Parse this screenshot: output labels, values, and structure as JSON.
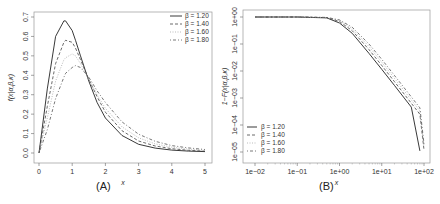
{
  "chart_data": [
    {
      "panel": "A",
      "type": "line",
      "caption": "(A)",
      "title": "",
      "xlabel": "x",
      "ylabel": "f(x|α,β,κ)",
      "xlim": [
        0,
        5
      ],
      "ylim": [
        0,
        0.7
      ],
      "xticks": [
        "0",
        "1",
        "2",
        "3",
        "4",
        "5"
      ],
      "yticks": [
        "0.0",
        "0.1",
        "0.2",
        "0.3",
        "0.4",
        "0.5",
        "0.6",
        "0.7"
      ],
      "grid": false,
      "legend_position": "top-right",
      "x": [
        0,
        0.25,
        0.5,
        0.75,
        0.8,
        1.0,
        1.1,
        1.25,
        1.5,
        1.75,
        2.0,
        2.5,
        3.0,
        3.5,
        4.0,
        4.5,
        5.0
      ],
      "series": [
        {
          "name": "β = 1.20",
          "style": "solid",
          "values": [
            0,
            0.33,
            0.6,
            0.68,
            0.68,
            0.63,
            0.58,
            0.5,
            0.37,
            0.26,
            0.18,
            0.09,
            0.045,
            0.025,
            0.015,
            0.01,
            0.007
          ]
        },
        {
          "name": "β = 1.40",
          "style": "dashed",
          "values": [
            0,
            0.24,
            0.46,
            0.57,
            0.58,
            0.57,
            0.54,
            0.48,
            0.38,
            0.29,
            0.21,
            0.115,
            0.062,
            0.036,
            0.022,
            0.014,
            0.01
          ]
        },
        {
          "name": "β = 1.60",
          "style": "dotted-light",
          "values": [
            0,
            0.18,
            0.37,
            0.48,
            0.49,
            0.51,
            0.5,
            0.46,
            0.38,
            0.3,
            0.23,
            0.135,
            0.078,
            0.047,
            0.03,
            0.02,
            0.014
          ]
        },
        {
          "name": "β = 1.80",
          "style": "dash-dot",
          "values": [
            0,
            0.12,
            0.28,
            0.39,
            0.41,
            0.44,
            0.45,
            0.44,
            0.39,
            0.32,
            0.26,
            0.16,
            0.097,
            0.06,
            0.038,
            0.026,
            0.018
          ]
        }
      ]
    },
    {
      "panel": "B",
      "type": "line",
      "caption": "(B)",
      "title": "",
      "xlabel": "x",
      "ylabel": "1−F(x|α,β,κ)",
      "xscale": "log",
      "yscale": "log",
      "xlim": [
        0.01,
        100
      ],
      "ylim": [
        1e-05,
        1
      ],
      "xticks": [
        "1e−02",
        "1e−01",
        "1e+00",
        "1e+01",
        "1e+02"
      ],
      "yticks": [
        "1e+00",
        "1e−01",
        "1e−02",
        "1e−03",
        "1e−04",
        "1e−05"
      ],
      "grid": false,
      "legend_position": "bottom-left",
      "x": [
        0.01,
        0.1,
        0.5,
        1,
        2,
        5,
        10,
        20,
        50,
        80,
        100
      ],
      "series": [
        {
          "name": "β = 1.20",
          "style": "solid",
          "values": [
            1.0,
            0.999,
            0.93,
            0.6,
            0.25,
            0.045,
            0.0115,
            0.0029,
            0.00046,
            1.1e-05,
            null
          ]
        },
        {
          "name": "β = 1.40",
          "style": "dashed",
          "values": [
            1.0,
            0.999,
            0.95,
            0.68,
            0.31,
            0.062,
            0.016,
            0.004,
            0.00064,
            0.00025,
            1.2e-05
          ]
        },
        {
          "name": "β = 1.60",
          "style": "dotted-light",
          "values": [
            1.0,
            0.999,
            0.96,
            0.74,
            0.37,
            0.08,
            0.021,
            0.0053,
            0.00085,
            0.00033,
            1.6e-05
          ]
        },
        {
          "name": "β = 1.80",
          "style": "dash-dot",
          "values": [
            1.0,
            0.999,
            0.97,
            0.78,
            0.42,
            0.1,
            0.027,
            0.0068,
            0.0011,
            0.00043,
            2e-05
          ]
        }
      ]
    }
  ],
  "panels": {
    "A": {
      "caption": "(A)",
      "xlabel": "x",
      "ylabel": "f(x|α,β,κ)",
      "legend": [
        "β = 1.20",
        "β = 1.40",
        "β = 1.60",
        "β = 1.80"
      ]
    },
    "B": {
      "caption": "(B)",
      "xlabel": "x",
      "ylabel": "1−F(x|α,β,κ)",
      "legend": [
        "β = 1.20",
        "β = 1.40",
        "β = 1.60",
        "β = 1.80"
      ]
    }
  }
}
